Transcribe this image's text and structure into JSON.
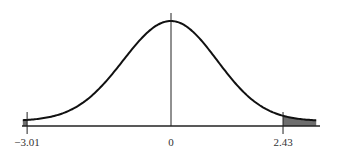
{
  "chart_data": {
    "type": "area",
    "title": "",
    "xlabel": "",
    "ylabel": "",
    "distribution": "standard normal",
    "x_range": [
      -3.1,
      3.15
    ],
    "tick_values": [
      -3.01,
      0,
      2.43
    ],
    "tick_labels": [
      "−3.01",
      "0",
      "2.43"
    ],
    "shaded_regions": [
      {
        "from": -3.1,
        "to": -3.01,
        "label": "left tail"
      },
      {
        "from": 2.43,
        "to": 3.15,
        "label": "right tail"
      }
    ],
    "center_line": 0,
    "grid": false,
    "legend": null,
    "colors": {
      "curve": "#111111",
      "shade": "#6e6e6e",
      "axis": "#222222"
    }
  }
}
